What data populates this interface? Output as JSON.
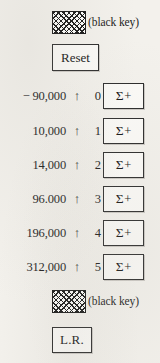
{
  "top_key": {
    "icon": "crosshatch-key-icon",
    "label": "(black key)"
  },
  "reset_button": {
    "label": "Reset"
  },
  "rows": [
    {
      "value": "− 90,000",
      "arrow": "↑",
      "index": "0",
      "sigma": "Σ",
      "plus": "+"
    },
    {
      "value": "10,000",
      "arrow": "↑",
      "index": "1",
      "sigma": "Σ",
      "plus": "+"
    },
    {
      "value": "14,000",
      "arrow": "↑",
      "index": "2",
      "sigma": "Σ",
      "plus": "+"
    },
    {
      "value": "96.000",
      "arrow": "↑",
      "index": "3",
      "sigma": "Σ",
      "plus": "+"
    },
    {
      "value": "196,000",
      "arrow": "↑",
      "index": "4",
      "sigma": "Σ",
      "plus": "+"
    },
    {
      "value": "312,000",
      "arrow": "↑",
      "index": "5",
      "sigma": "Σ",
      "plus": "+"
    }
  ],
  "bottom_key": {
    "icon": "crosshatch-key-icon",
    "label": "(black key)"
  },
  "lr_button": {
    "label": "L.R."
  },
  "colors": {
    "paper": "#f3f1ec",
    "ink": "#141414",
    "button_face": "#fbfaf7"
  }
}
